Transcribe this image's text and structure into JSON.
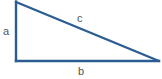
{
  "diagram": {
    "type": "right-triangle",
    "labels": {
      "a": "a",
      "b": "b",
      "c": "c"
    },
    "sides": {
      "a": "vertical leg (left)",
      "b": "horizontal leg (bottom)",
      "c": "hypotenuse"
    },
    "colors": {
      "stroke": "#2b5d93",
      "label": "#555555",
      "background": "#ffffff"
    }
  }
}
